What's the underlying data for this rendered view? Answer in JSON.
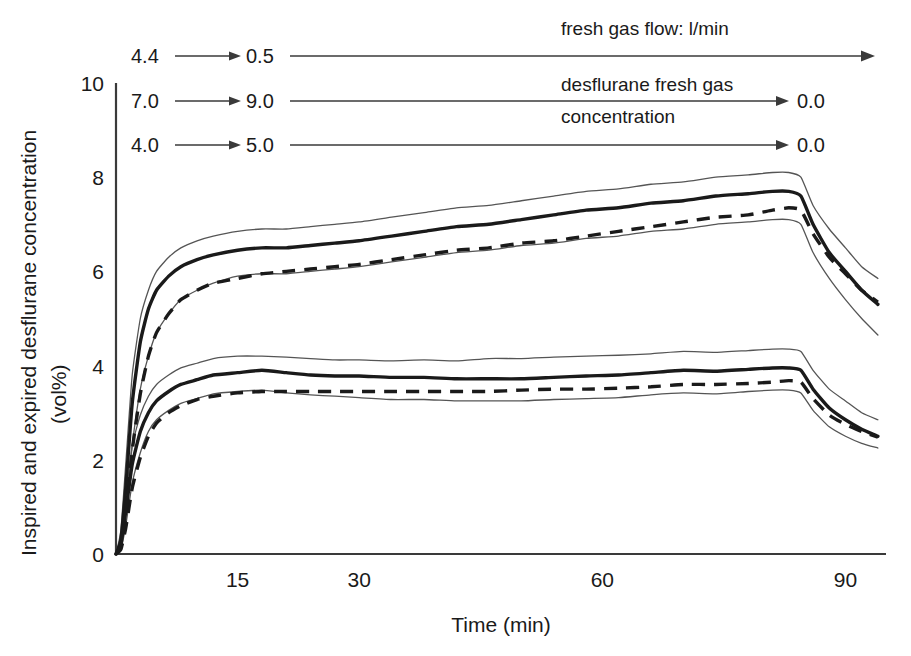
{
  "chart_data": {
    "type": "line",
    "title": "",
    "xlabel": "Time (min)",
    "ylabel": "Inspired and expired desflurane concentration (vol%)",
    "ylabel_line1": "Inspired and expired desflurane concentration",
    "ylabel_line2": "(vol%)",
    "xlim": [
      0,
      95
    ],
    "ylim": [
      0,
      10
    ],
    "xticks": [
      15,
      30,
      60,
      90
    ],
    "xtick_labels": [
      "15",
      "30",
      "60",
      "90"
    ],
    "yticks": [
      0,
      2,
      4,
      6,
      8,
      10
    ],
    "ytick_labels": [
      "0",
      "2",
      "4",
      "6",
      "8",
      "10"
    ],
    "grid": false,
    "legend": "none",
    "x": [
      0,
      0.6,
      1.2,
      2,
      3,
      4,
      5,
      6.5,
      8,
      10,
      12,
      15,
      18,
      21,
      24,
      27,
      30,
      34,
      38,
      42,
      46,
      50,
      54,
      58,
      62,
      66,
      70,
      74,
      78,
      81,
      83,
      84.5,
      86,
      88,
      90,
      92,
      94
    ],
    "series": [
      {
        "name": "inspired-mean",
        "style": "solid-thick",
        "values": [
          0,
          0.3,
          1.4,
          3.2,
          4.5,
          5.2,
          5.6,
          5.9,
          6.1,
          6.25,
          6.35,
          6.45,
          6.5,
          6.5,
          6.55,
          6.6,
          6.65,
          6.75,
          6.85,
          6.95,
          7.0,
          7.1,
          7.2,
          7.3,
          7.35,
          7.45,
          7.5,
          7.6,
          7.65,
          7.7,
          7.7,
          7.6,
          7.0,
          6.4,
          6.0,
          5.6,
          5.3
        ]
      },
      {
        "name": "inspired-upper-sd",
        "style": "thin",
        "values": [
          0,
          0.5,
          1.9,
          3.8,
          5.0,
          5.6,
          6.0,
          6.3,
          6.5,
          6.65,
          6.75,
          6.85,
          6.9,
          6.9,
          6.95,
          7.0,
          7.05,
          7.15,
          7.25,
          7.35,
          7.4,
          7.5,
          7.6,
          7.7,
          7.75,
          7.85,
          7.9,
          8.0,
          8.05,
          8.1,
          8.1,
          8.0,
          7.4,
          6.9,
          6.5,
          6.1,
          5.85
        ]
      },
      {
        "name": "inspired-lower-sd",
        "style": "thin",
        "values": [
          0,
          0.15,
          0.9,
          2.3,
          3.5,
          4.2,
          4.7,
          5.1,
          5.4,
          5.6,
          5.75,
          5.9,
          5.95,
          5.95,
          6.0,
          6.05,
          6.1,
          6.2,
          6.3,
          6.4,
          6.45,
          6.55,
          6.6,
          6.7,
          6.75,
          6.85,
          6.9,
          7.0,
          7.05,
          7.1,
          7.1,
          7.0,
          6.4,
          5.85,
          5.4,
          5.0,
          4.65
        ]
      },
      {
        "name": "expired-mean",
        "style": "dashed-thick",
        "values": [
          0,
          0.15,
          0.8,
          2.2,
          3.4,
          4.2,
          4.7,
          5.1,
          5.4,
          5.6,
          5.75,
          5.85,
          5.95,
          6.0,
          6.05,
          6.1,
          6.15,
          6.25,
          6.35,
          6.45,
          6.5,
          6.6,
          6.65,
          6.75,
          6.85,
          6.95,
          7.05,
          7.15,
          7.2,
          7.3,
          7.35,
          7.3,
          6.8,
          6.3,
          5.95,
          5.6,
          5.35
        ]
      },
      {
        "name": "expired-alv-mean",
        "style": "solid-thick",
        "values": [
          0,
          0.2,
          0.9,
          1.9,
          2.6,
          3.0,
          3.25,
          3.45,
          3.6,
          3.7,
          3.8,
          3.85,
          3.9,
          3.85,
          3.8,
          3.78,
          3.78,
          3.75,
          3.75,
          3.72,
          3.72,
          3.72,
          3.75,
          3.78,
          3.8,
          3.85,
          3.9,
          3.88,
          3.92,
          3.95,
          3.95,
          3.9,
          3.5,
          3.1,
          2.85,
          2.65,
          2.5
        ]
      },
      {
        "name": "expired-alv-upper-sd",
        "style": "thin",
        "values": [
          0,
          0.35,
          1.2,
          2.3,
          2.95,
          3.35,
          3.6,
          3.8,
          3.95,
          4.05,
          4.15,
          4.2,
          4.2,
          4.18,
          4.15,
          4.12,
          4.12,
          4.1,
          4.12,
          4.1,
          4.15,
          4.15,
          4.18,
          4.2,
          4.22,
          4.25,
          4.3,
          4.28,
          4.32,
          4.35,
          4.35,
          4.3,
          3.9,
          3.5,
          3.25,
          3.0,
          2.85
        ]
      },
      {
        "name": "expired-alv-lower-sd",
        "style": "thin",
        "values": [
          0,
          0.1,
          0.6,
          1.5,
          2.15,
          2.6,
          2.85,
          3.05,
          3.2,
          3.3,
          3.4,
          3.45,
          3.48,
          3.42,
          3.38,
          3.35,
          3.32,
          3.28,
          3.28,
          3.25,
          3.25,
          3.25,
          3.28,
          3.3,
          3.32,
          3.38,
          3.42,
          3.4,
          3.45,
          3.48,
          3.48,
          3.42,
          3.05,
          2.7,
          2.5,
          2.35,
          2.25
        ]
      },
      {
        "name": "expired-alv-dashed",
        "style": "dashed-thick",
        "values": [
          0,
          0.1,
          0.55,
          1.4,
          2.05,
          2.5,
          2.78,
          3.0,
          3.15,
          3.28,
          3.35,
          3.42,
          3.45,
          3.45,
          3.45,
          3.45,
          3.45,
          3.45,
          3.45,
          3.45,
          3.45,
          3.48,
          3.5,
          3.5,
          3.52,
          3.55,
          3.6,
          3.6,
          3.62,
          3.65,
          3.68,
          3.65,
          3.3,
          2.95,
          2.75,
          2.6,
          2.48
        ]
      }
    ]
  },
  "annotations": {
    "row1": {
      "name": "fresh-gas-flow",
      "start_value": "4.4",
      "end_value": "0.5",
      "caption": "fresh gas flow: l/min",
      "final_value": ""
    },
    "row2": {
      "name": "desflurane-fresh-gas-concentration-upper",
      "start_value": "7.0",
      "end_value": "9.0",
      "caption_line1": "desflurane fresh gas",
      "caption_line2": "concentration",
      "final_value": "0.0"
    },
    "row3": {
      "name": "desflurane-fresh-gas-concentration-lower",
      "start_value": "4.0",
      "end_value": "5.0",
      "caption": "",
      "final_value": "0.0"
    }
  },
  "colors": {
    "ink": "#1a1a1a",
    "axis": "#3a3a3a",
    "envelope": "#555555",
    "background": "#ffffff"
  }
}
